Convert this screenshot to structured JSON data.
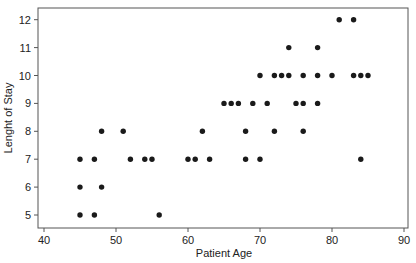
{
  "chart_data": {
    "type": "scatter",
    "title": "",
    "xlabel": "Patient Age",
    "ylabel": "Lenght of Stay",
    "xlim": [
      38,
      91
    ],
    "ylim": [
      4.5,
      12.4
    ],
    "xticks": [
      40,
      50,
      60,
      70,
      80,
      90
    ],
    "yticks": [
      5,
      6,
      7,
      8,
      9,
      10,
      11,
      12
    ],
    "grid": false,
    "legend": null,
    "points": [
      {
        "x": 45,
        "y": 5
      },
      {
        "x": 47,
        "y": 5
      },
      {
        "x": 56,
        "y": 5
      },
      {
        "x": 45,
        "y": 6
      },
      {
        "x": 48,
        "y": 6
      },
      {
        "x": 45,
        "y": 7
      },
      {
        "x": 47,
        "y": 7
      },
      {
        "x": 52,
        "y": 7
      },
      {
        "x": 54,
        "y": 7
      },
      {
        "x": 55,
        "y": 7
      },
      {
        "x": 60,
        "y": 7
      },
      {
        "x": 61,
        "y": 7
      },
      {
        "x": 63,
        "y": 7
      },
      {
        "x": 68,
        "y": 7
      },
      {
        "x": 70,
        "y": 7
      },
      {
        "x": 84,
        "y": 7
      },
      {
        "x": 48,
        "y": 8
      },
      {
        "x": 51,
        "y": 8
      },
      {
        "x": 62,
        "y": 8
      },
      {
        "x": 68,
        "y": 8
      },
      {
        "x": 72,
        "y": 8
      },
      {
        "x": 76,
        "y": 8
      },
      {
        "x": 65,
        "y": 9
      },
      {
        "x": 66,
        "y": 9
      },
      {
        "x": 67,
        "y": 9
      },
      {
        "x": 69,
        "y": 9
      },
      {
        "x": 71,
        "y": 9
      },
      {
        "x": 75,
        "y": 9
      },
      {
        "x": 76,
        "y": 9
      },
      {
        "x": 78,
        "y": 9
      },
      {
        "x": 70,
        "y": 10
      },
      {
        "x": 72,
        "y": 10
      },
      {
        "x": 73,
        "y": 10
      },
      {
        "x": 74,
        "y": 10
      },
      {
        "x": 76,
        "y": 10
      },
      {
        "x": 78,
        "y": 10
      },
      {
        "x": 80,
        "y": 10
      },
      {
        "x": 83,
        "y": 10
      },
      {
        "x": 84,
        "y": 10
      },
      {
        "x": 85,
        "y": 10
      },
      {
        "x": 74,
        "y": 11
      },
      {
        "x": 78,
        "y": 11
      },
      {
        "x": 81,
        "y": 12
      },
      {
        "x": 83,
        "y": 12
      }
    ]
  }
}
